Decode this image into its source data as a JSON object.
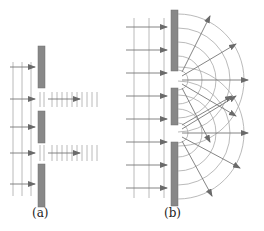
{
  "diagram": {
    "panels": [
      {
        "id": "a",
        "label": "(a)",
        "behavior": "rays pass straight through slits, no spreading"
      },
      {
        "id": "b",
        "label": "(b)",
        "behavior": "diffraction: circular wavefronts spread from each slit"
      }
    ],
    "colors": {
      "barrier": "#888888",
      "barrier_edge": "#6f6f6f",
      "wavefront": "#a8a8a8",
      "ray": "#777777",
      "arrowhead": "#6a6a6a"
    }
  }
}
